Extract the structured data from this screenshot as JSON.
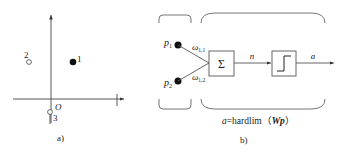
{
  "panel_a": {
    "caption": "a)",
    "origin_label": "O",
    "points": [
      {
        "label": "1",
        "style": "filled"
      },
      {
        "label": "2",
        "style": "hollow"
      },
      {
        "label": "3",
        "style": "hollow"
      }
    ]
  },
  "panel_b": {
    "caption": "b)",
    "inputs": [
      {
        "label": "p",
        "sub": "1"
      },
      {
        "label": "p",
        "sub": "2"
      }
    ],
    "weights": [
      {
        "label": "ω",
        "sub": "1,1"
      },
      {
        "label": "ω",
        "sub": "1,2"
      }
    ],
    "sum_symbol": "Σ",
    "net_label": "n",
    "output_label": "a",
    "formula": {
      "lhs": "a",
      "eq": "=hardlim",
      "open": "（",
      "arg": "Wp",
      "close": "）"
    }
  },
  "colors": {
    "stroke": "#555555",
    "text": "#222222",
    "background": "#ffffff"
  }
}
